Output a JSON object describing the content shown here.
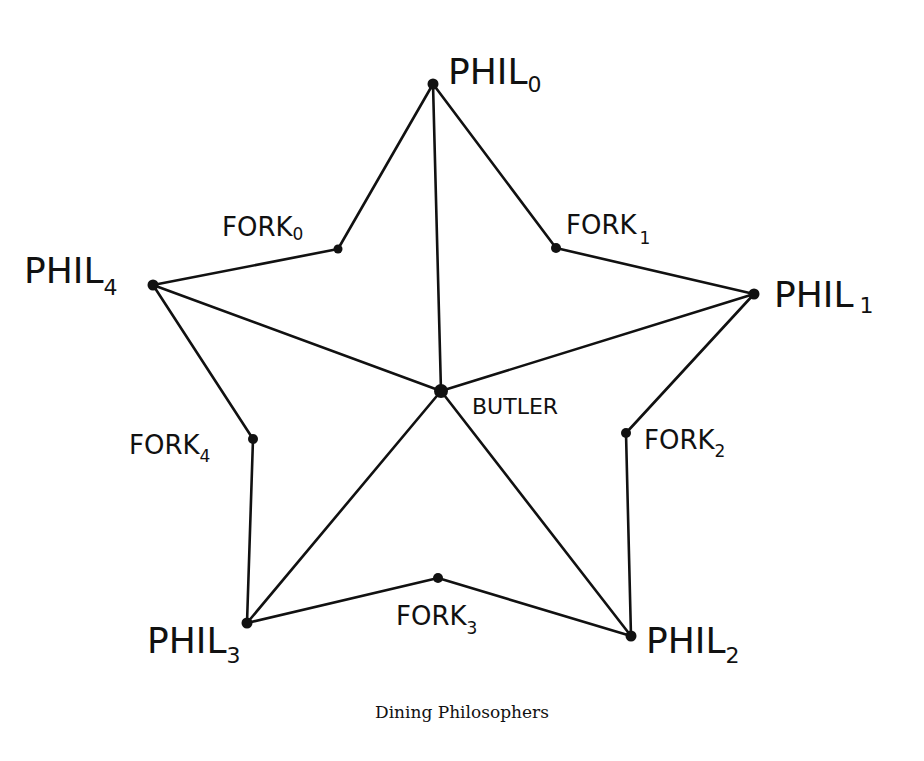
{
  "diagram": {
    "caption": "Dining Philosophers",
    "nodes": {
      "phil0": {
        "main": "PHIL",
        "sub": "0",
        "x": 433,
        "y": 84
      },
      "phil1": {
        "main": "PHIL",
        "sub": "1",
        "x": 754,
        "y": 294
      },
      "phil2": {
        "main": "PHIL",
        "sub": "2",
        "x": 631,
        "y": 636
      },
      "phil3": {
        "main": "PHIL",
        "sub": "3",
        "x": 247,
        "y": 623
      },
      "phil4": {
        "main": "PHIL",
        "sub": "4",
        "x": 153,
        "y": 285
      },
      "fork0": {
        "main": "FORK",
        "sub": "0",
        "x": 338,
        "y": 249
      },
      "fork1": {
        "main": "FORK",
        "sub": "1",
        "x": 556,
        "y": 248
      },
      "fork2": {
        "main": "FORK",
        "sub": "2",
        "x": 626,
        "y": 433
      },
      "fork3": {
        "main": "FORK",
        "sub": "3",
        "x": 438,
        "y": 578
      },
      "fork4": {
        "main": "FORK",
        "sub": "4",
        "x": 253,
        "y": 439
      },
      "butler": {
        "main": "BUTLER",
        "x": 441,
        "y": 391
      }
    },
    "edges": [
      [
        "phil0",
        "fork0"
      ],
      [
        "phil0",
        "fork1"
      ],
      [
        "phil0",
        "butler"
      ],
      [
        "phil1",
        "fork1"
      ],
      [
        "phil1",
        "fork2"
      ],
      [
        "phil1",
        "butler"
      ],
      [
        "phil2",
        "fork2"
      ],
      [
        "phil2",
        "fork3"
      ],
      [
        "phil2",
        "butler"
      ],
      [
        "phil3",
        "fork3"
      ],
      [
        "phil3",
        "fork4"
      ],
      [
        "phil3",
        "butler"
      ],
      [
        "phil4",
        "fork4"
      ],
      [
        "phil4",
        "fork0"
      ],
      [
        "phil4",
        "butler"
      ]
    ]
  }
}
